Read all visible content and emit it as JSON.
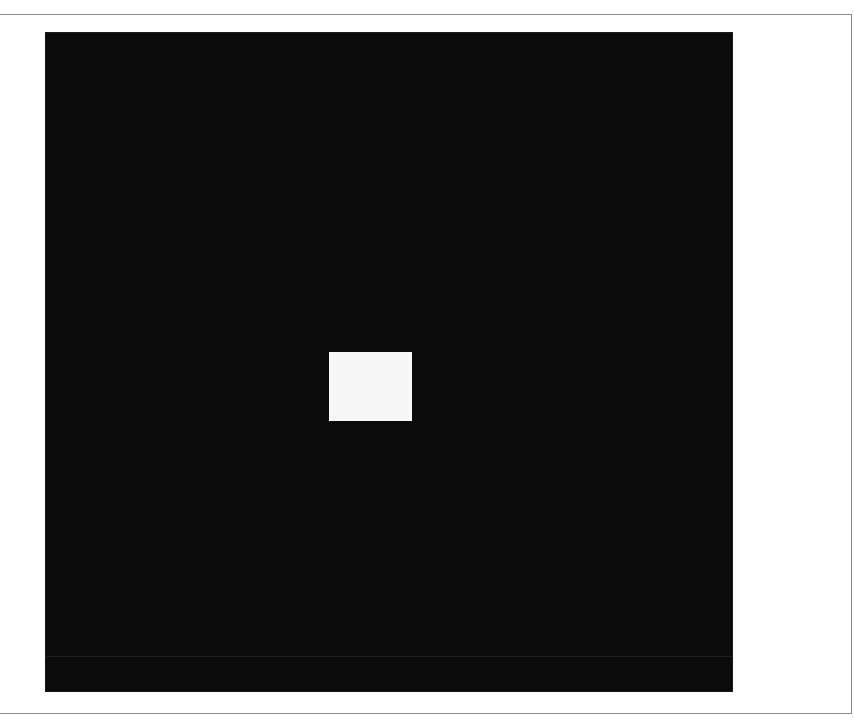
{
  "window": {
    "title": ""
  },
  "canvas": {
    "background_color": "#0b0b0b",
    "x": 46,
    "y": 33,
    "width": 686,
    "height": 658
  },
  "square": {
    "color": "#f7f7f7",
    "x": 329,
    "y": 352,
    "width": 83,
    "height": 69
  },
  "frame": {
    "border_color": "#8a8a8a"
  }
}
